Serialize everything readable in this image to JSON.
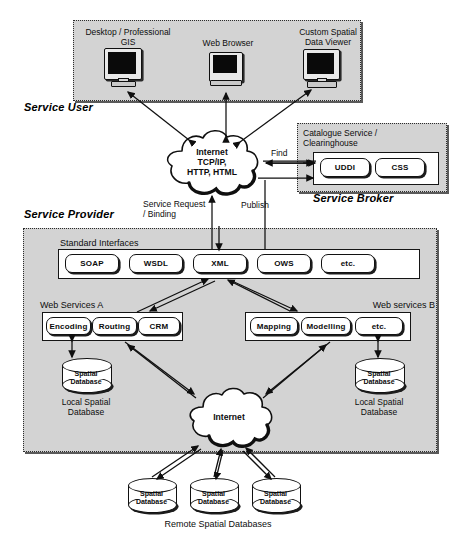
{
  "diagram": {
    "zones": [
      {
        "key": "service_user",
        "title": "Service User"
      },
      {
        "key": "service_broker",
        "title": "Service Broker"
      },
      {
        "key": "service_provider",
        "title": "Service Provider"
      }
    ]
  },
  "service_user": {
    "zone_label": "Service User",
    "clients": [
      {
        "label": "Desktop / Professional\nGIS",
        "icon": "desktop-monitor-icon"
      },
      {
        "label": "Web Browser",
        "icon": "desktop-monitor-icon"
      },
      {
        "label": "Custom Spatial\nData Viewer",
        "icon": "desktop-monitor-icon"
      }
    ]
  },
  "internet_top": {
    "icon": "cloud-icon",
    "label": "Internet\nTCP/IP,\nHTTP, HTML"
  },
  "service_broker": {
    "zone_label": "Service Broker",
    "panel_title": "Catalogue Service /\nClearinghouse",
    "registries": [
      {
        "label": "UDDI"
      },
      {
        "label": "CSS"
      }
    ]
  },
  "connections": {
    "find": "Find",
    "publish": "Publish",
    "service_request": "Service Request\n/ Binding"
  },
  "service_provider": {
    "zone_label": "Service Provider",
    "standard_interfaces": {
      "title": "Standard Interfaces",
      "items": [
        {
          "label": "SOAP"
        },
        {
          "label": "WSDL"
        },
        {
          "label": "XML"
        },
        {
          "label": "OWS"
        },
        {
          "label": "etc."
        }
      ]
    },
    "web_services_a": {
      "title": "Web Services A",
      "items": [
        {
          "label": "Encoding"
        },
        {
          "label": "Routing"
        },
        {
          "label": "CRM"
        }
      ],
      "database": {
        "cap_label": "Spatial\nDatabase",
        "caption": "Local Spatial\nDatabase"
      }
    },
    "web_services_b": {
      "title": "Web services B",
      "items": [
        {
          "label": "Mapping"
        },
        {
          "label": "Modelling"
        },
        {
          "label": "etc."
        }
      ],
      "database": {
        "cap_label": "Spatial\nDatabase",
        "caption": "Local Spatial\nDatabase"
      }
    },
    "internet_inner": {
      "icon": "cloud-icon",
      "label": "Internet"
    }
  },
  "remote_databases": {
    "caption": "Remote Spatial Databases",
    "items": [
      {
        "cap_label": "Spatial\nDatabase"
      },
      {
        "cap_label": "Spatial\nDatabase"
      },
      {
        "cap_label": "Spatial\nDatabase"
      }
    ]
  },
  "colors": {
    "zone_fill": "#d3d3d3",
    "panel_fill": "#ffffff",
    "stroke": "#111111",
    "screen": "#0a0a0a",
    "shadow": "#5a5a5a"
  }
}
